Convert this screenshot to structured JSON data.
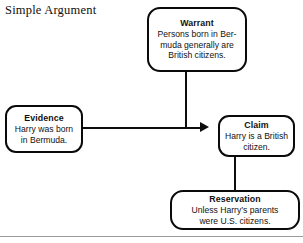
{
  "title": "Simple Argument",
  "diagram": {
    "kind": "toulmin-argument-model",
    "nodes": [
      {
        "id": "warrant",
        "heading": "Warrant",
        "lines": [
          "Persons born in Ber-",
          "muda generally are",
          "British citizens."
        ]
      },
      {
        "id": "evidence",
        "heading": "Evidence",
        "lines": [
          "Harry was born",
          "in Bermuda."
        ]
      },
      {
        "id": "claim",
        "heading": "Claim",
        "lines": [
          "Harry is a British",
          "citizen."
        ]
      },
      {
        "id": "reservation",
        "heading": "Reservation",
        "lines": [
          "Unless Harry’s parents",
          "were U.S. citizens."
        ]
      }
    ],
    "edges": [
      {
        "id": "evidence-to-claim",
        "from": "evidence",
        "to": "claim",
        "arrow": "arrowhead-right"
      },
      {
        "id": "warrant-to-edge",
        "from": "warrant",
        "to": "evidence-to-claim",
        "arrow": "none"
      },
      {
        "id": "claim-to-reservation",
        "from": "claim",
        "to": "reservation",
        "arrow": "none"
      }
    ]
  },
  "colors": {
    "background": "#ffffff",
    "stroke": "#0a0a0a",
    "text": "#111111",
    "divider": "#9a9a9a"
  }
}
